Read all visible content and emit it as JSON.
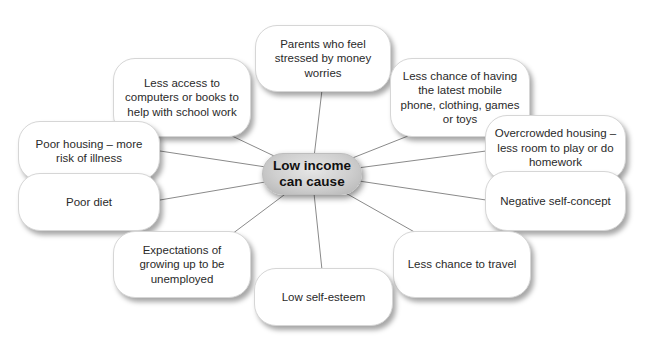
{
  "center": {
    "line1": "Low income",
    "line2": "can cause"
  },
  "nodes": [
    {
      "id": "parents-stressed",
      "text": "Parents who feel stressed by money worries"
    },
    {
      "id": "less-access",
      "text": "Less access to computers or books to help with school work"
    },
    {
      "id": "latest-items",
      "text": "Less chance of having the latest mobile phone, clothing, games or toys"
    },
    {
      "id": "poor-housing",
      "text": "Poor housing – more risk of illness"
    },
    {
      "id": "overcrowded",
      "text": "Overcrowded housing – less room to play or do homework"
    },
    {
      "id": "poor-diet",
      "text": "Poor diet"
    },
    {
      "id": "negative-self-concept",
      "text": "Negative self-concept"
    },
    {
      "id": "expectations",
      "text": "Expectations of growing up to be unemployed"
    },
    {
      "id": "travel",
      "text": "Less chance to travel"
    },
    {
      "id": "self-esteem",
      "text": "Low self-esteem"
    }
  ],
  "colors": {
    "line": "#8a8a8a",
    "node_border": "#d6d6d6",
    "center_fill": "#cfcfcf"
  }
}
